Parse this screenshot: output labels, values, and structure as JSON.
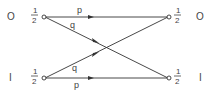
{
  "diagram": {
    "type": "binary-channel-transition",
    "left_states": [
      {
        "label": "O",
        "prob_num": "1",
        "prob_den": "2"
      },
      {
        "label": "I",
        "prob_num": "1",
        "prob_den": "2"
      }
    ],
    "right_states": [
      {
        "label": "O",
        "prob_num": "1",
        "prob_den": "2"
      },
      {
        "label": "I",
        "prob_num": "1",
        "prob_den": "2"
      }
    ],
    "edges": [
      {
        "from": "O",
        "to": "O",
        "label": "p"
      },
      {
        "from": "O",
        "to": "I",
        "label": "q"
      },
      {
        "from": "I",
        "to": "O",
        "label": "q"
      },
      {
        "from": "I",
        "to": "I",
        "label": "p"
      }
    ],
    "colors": {
      "line": "#333333",
      "text": "#444444"
    }
  }
}
